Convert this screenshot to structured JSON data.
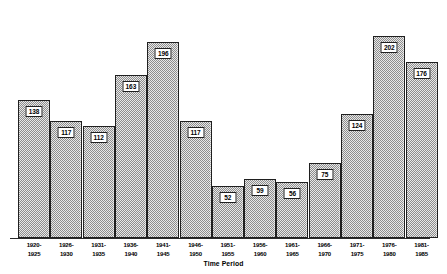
{
  "chart_data": {
    "type": "bar",
    "title": "",
    "xlabel": "Time Period",
    "ylabel": "",
    "grid": false,
    "legend": "none",
    "ylim": [
      0,
      232
    ],
    "categories": [
      "1920-1925",
      "1926-1930",
      "1931-1935",
      "1936-1940",
      "1941-1945",
      "1946-1950",
      "1951-1955",
      "1956-1960",
      "1961-1965",
      "1966-1970",
      "1971-1975",
      "1976-1980",
      "1981-1985"
    ],
    "category_lines": [
      [
        "1920-",
        "1925"
      ],
      [
        "1926-",
        "1930"
      ],
      [
        "1931-",
        "1935"
      ],
      [
        "1936-",
        "1940"
      ],
      [
        "1941-",
        "1945"
      ],
      [
        "1946-",
        "1950"
      ],
      [
        "1951-",
        "1955"
      ],
      [
        "1956-",
        "1960"
      ],
      [
        "1961-",
        "1965"
      ],
      [
        "1966-",
        "1970"
      ],
      [
        "1971-",
        "1975"
      ],
      [
        "1976-",
        "1980"
      ],
      [
        "1981-",
        "1985"
      ]
    ],
    "values": [
      138,
      117,
      112,
      163,
      196,
      117,
      52,
      59,
      56,
      75,
      124,
      202,
      176
    ],
    "value_labels": [
      "138",
      "117",
      "112",
      "163",
      "196",
      "117",
      "52",
      "59",
      "56",
      "75",
      "124",
      "202",
      "176"
    ],
    "colors": {
      "bar_fill_light": "#e8e8e8",
      "bar_fill_dark": "#8d8d8d",
      "bar_border": "#1f1f1f",
      "axis": "#2a2a2a",
      "label_box_bg": "#ffffff",
      "text": "#000000",
      "background": "#ffffff"
    }
  }
}
